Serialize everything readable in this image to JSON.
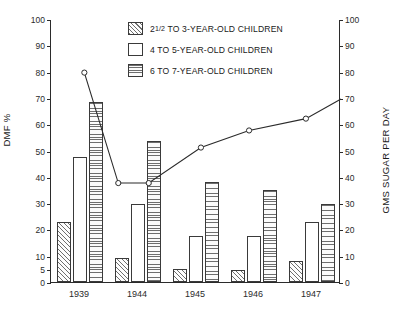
{
  "chart_data": {
    "type": "bar",
    "title": "",
    "subtitle": "",
    "categories": [
      "1939",
      "1944",
      "1945",
      "1946",
      "1947"
    ],
    "series": [
      {
        "name": "2¹/₂ TO 3-YEAR-OLD CHILDREN",
        "pattern": "diagonal-hatch",
        "axis": "left",
        "values": [
          23,
          9,
          5,
          4.5,
          8
        ]
      },
      {
        "name": "4 TO 5-YEAR-OLD CHILDREN",
        "pattern": "plain-white",
        "axis": "left",
        "values": [
          47.5,
          29.5,
          17.5,
          17.5,
          23
        ]
      },
      {
        "name": "6 TO 7-YEAR-OLD CHILDREN",
        "pattern": "horizontal-hatch",
        "axis": "left",
        "values": [
          68.5,
          53.5,
          38,
          35,
          29.5
        ]
      }
    ],
    "line_series": {
      "name": "GMS SUGAR PER DAY",
      "axis": "right",
      "marker": "open-circle",
      "points": [
        {
          "x_frac": 0.115,
          "value": 80,
          "marker": true
        },
        {
          "x_frac": 0.232,
          "value": 38,
          "marker": true
        },
        {
          "x_frac": 0.337,
          "value": 38,
          "marker": true
        },
        {
          "x_frac": 0.517,
          "value": 51.5,
          "marker": true
        },
        {
          "x_frac": 0.683,
          "value": 58,
          "marker": true
        },
        {
          "x_frac": 0.879,
          "value": 62.5,
          "marker": true
        },
        {
          "x_frac": 1.0,
          "value": 70,
          "marker": false
        }
      ]
    },
    "xlabel": "",
    "ylabel": "DMF %",
    "y2label": "GMS SUGAR PER DAY",
    "ylim": [
      0,
      100
    ],
    "y2lim": [
      0,
      100
    ],
    "yticks": [
      0,
      5,
      10,
      20,
      30,
      40,
      50,
      60,
      70,
      80,
      90,
      100
    ],
    "y2ticks": [
      0,
      10,
      20,
      30,
      40,
      50,
      60,
      70,
      80,
      90,
      100
    ],
    "grid": false,
    "legend_position": "top-center"
  },
  "axes": {
    "left_title": "DMF %",
    "right_title": "GMS SUGAR PER DAY",
    "left_ticks": [
      "100",
      "90",
      "80",
      "70",
      "60",
      "50",
      "40",
      "30",
      "20",
      "10",
      "5",
      "0"
    ],
    "right_ticks": [
      "100",
      "90",
      "80",
      "70",
      "60",
      "50",
      "40",
      "30",
      "20",
      "10",
      "0"
    ]
  },
  "legend": {
    "items": [
      {
        "label_prefix": "2",
        "label_fraction": "1/2",
        "label_rest": " TO 3-YEAR-OLD CHILDREN",
        "full": "2¹/₂ TO 3-YEAR-OLD CHILDREN",
        "swatch": "diagonal-hatch"
      },
      {
        "label_prefix": "",
        "label_fraction": "",
        "label_rest": "4 TO 5-YEAR-OLD CHILDREN",
        "full": "4 TO 5-YEAR-OLD CHILDREN",
        "swatch": "plain-white"
      },
      {
        "label_prefix": "",
        "label_fraction": "",
        "label_rest": "6 TO 7-YEAR-OLD CHILDREN",
        "full": "6 TO 7-YEAR-OLD CHILDREN",
        "swatch": "horizontal-hatch"
      }
    ]
  },
  "colors": {
    "ink": "#2b2b2b",
    "hatch": "#6e6e6e",
    "background": "#ffffff"
  }
}
